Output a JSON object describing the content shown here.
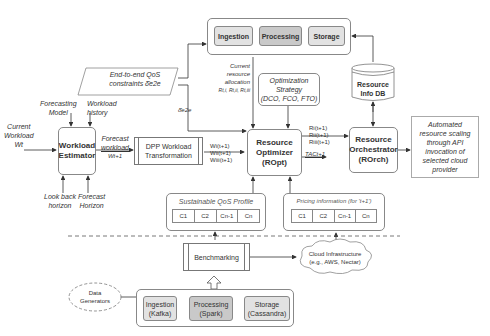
{
  "top_pipeline": {
    "stages": [
      "Ingestion",
      "Processing",
      "Storage"
    ]
  },
  "qos_constraints": "End-to-end QoS constraints δ̄e2e",
  "qos_symbol": "δ̄e2e",
  "current_allocation": {
    "lines": [
      "Current",
      "resource",
      "allocation",
      "Rt,i, Rt,ii, Rt,iii"
    ]
  },
  "optimization_strategy": {
    "lines": [
      "Optimization",
      "Strategy",
      "(DCO, FCO, FTO)"
    ]
  },
  "resource_db": {
    "lines": [
      "Resource",
      "Info DB"
    ]
  },
  "workload_estimator": {
    "lines": [
      "Workload",
      "Estimator"
    ],
    "inputs_top": [
      {
        "lines": [
          "Forecasting",
          "Model"
        ]
      },
      {
        "lines": [
          "Workload",
          "history"
        ]
      }
    ],
    "inputs_bottom": [
      {
        "lines": [
          "Look back",
          "horizon"
        ]
      },
      {
        "lines": [
          "Forecast",
          "Horizon"
        ]
      }
    ],
    "current_workload": [
      "Current",
      "Workload",
      "Wt"
    ]
  },
  "forecast_workload": [
    "Forecast",
    "workload",
    "Wt+1"
  ],
  "dpp_transform": {
    "lines": [
      "DPP Workload",
      "Transformation"
    ],
    "outputs": [
      "Wi(t+1)",
      "Wii(t+1)",
      "Wiii(t+1)"
    ]
  },
  "resource_optimizer": {
    "lines": [
      "Resource",
      "Optimizer",
      "(ROpt)"
    ],
    "outputs": [
      "Ri(t+1)",
      "Rii(t+1)",
      "Riii(t+1)",
      "TACt+1"
    ]
  },
  "resource_orchestrator": {
    "lines": [
      "Resource",
      "Orchestrator",
      "(ROrch)"
    ]
  },
  "automated_scaling": {
    "lines": [
      "Automated",
      "resource scaling",
      "through API",
      "invocation of",
      "selected cloud",
      "provider"
    ]
  },
  "sustainable_qos": {
    "title": "Sustainable QoS Profile",
    "cells": [
      "C1",
      "C2",
      "Cn-1",
      "Cn"
    ]
  },
  "pricing_info": {
    "title": "Pricing information (for 't+1')",
    "cells": [
      "C1",
      "C2",
      "Cn-1",
      "Cn"
    ]
  },
  "benchmarking": "Benchmarking",
  "cloud_infra": [
    "Cloud Infrastructure",
    "(e.g., AWS, Nectar)"
  ],
  "data_generators": [
    "Data",
    "Generators"
  ],
  "bottom_pipeline": {
    "stages": [
      {
        "lines": [
          "Ingestion",
          "(Kafka)"
        ]
      },
      {
        "lines": [
          "Processing",
          "(Spark)"
        ]
      },
      {
        "lines": [
          "Storage",
          "(Cassandra)"
        ]
      }
    ]
  }
}
